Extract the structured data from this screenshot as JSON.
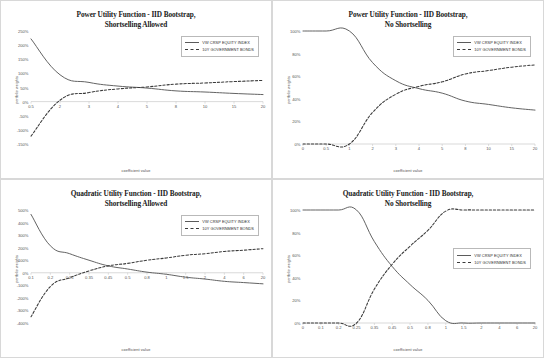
{
  "figure": {
    "background": "#f7f7f7",
    "panel_background": "#ffffff",
    "series_colors": {
      "equity": "#5b5b5b",
      "bonds": "#3a3a3a"
    }
  },
  "legend": {
    "equity_label": "VW CRSP EQUITY INDEX",
    "bonds_label": "10Y GOVERNMENT BONDS"
  },
  "chart_data": [
    {
      "type": "line",
      "panel": "top-left",
      "title_line1": "Power Utility Function - IID Bootstrap,",
      "title_line2": "Shortselling Allowed",
      "xlabel": "coefficient value",
      "ylabel": "portfolio weights",
      "categories": [
        "0.5",
        "2",
        "3",
        "4",
        "5",
        "8",
        "10",
        "15",
        "20"
      ],
      "ytick_labels": [
        "250%",
        "200%",
        "150%",
        "100%",
        "50%",
        "0%",
        "-50%",
        "-100%",
        "-150%"
      ],
      "ylim": [
        -150,
        250
      ],
      "grid": false,
      "legend_position": "top-right",
      "series": [
        {
          "name": "VW CRSP EQUITY INDEX",
          "style": "solid",
          "values": [
            222,
            95,
            68,
            55,
            48,
            38,
            34,
            29,
            25
          ]
        },
        {
          "name": "10Y GOVERNMENT BONDS",
          "style": "dashed",
          "values": [
            -122,
            5,
            32,
            45,
            52,
            62,
            66,
            71,
            75
          ]
        }
      ]
    },
    {
      "type": "line",
      "panel": "top-right",
      "title_line1": "Power Utility Function - IID Bootstrap,",
      "title_line2": "No Shortselling",
      "xlabel": "coefficient value",
      "ylabel": "portfolio weights",
      "categories": [
        "0",
        "0.5",
        "1",
        "2",
        "3",
        "4",
        "5",
        "8",
        "10",
        "15",
        "20"
      ],
      "ytick_labels": [
        "100%",
        "80%",
        "60%",
        "40%",
        "20%",
        "0%"
      ],
      "ylim": [
        0,
        100
      ],
      "grid": false,
      "legend_position": "top-right",
      "series": [
        {
          "name": "VW CRSP EQUITY INDEX",
          "style": "solid",
          "values": [
            100,
            100,
            100,
            72,
            56,
            49,
            45,
            38,
            35,
            32,
            30
          ]
        },
        {
          "name": "10Y GOVERNMENT BONDS",
          "style": "dashed",
          "values": [
            0,
            0,
            0,
            28,
            44,
            51,
            55,
            62,
            65,
            68,
            70
          ]
        }
      ]
    },
    {
      "type": "line",
      "panel": "bottom-left",
      "title_line1": "Quadratic Utility Function - IID Bootstrap,",
      "title_line2": "Shortselling Allowed",
      "xlabel": "coefficient value",
      "ylabel": "portfolio weights",
      "categories": [
        "0.1",
        "0.2",
        "0.25",
        "0.35",
        "0.45",
        "0.5",
        "0.8",
        "1",
        "1.5",
        "2",
        "4",
        "6",
        "20"
      ],
      "ytick_labels": [
        "500%",
        "400%",
        "300%",
        "200%",
        "100%",
        "0%",
        "-100%",
        "-200%",
        "-300%",
        "-400%"
      ],
      "ylim": [
        -400,
        500
      ],
      "grid": false,
      "legend_position": "top-right",
      "series": [
        {
          "name": "VW CRSP EQUITY INDEX",
          "style": "solid",
          "values": [
            465,
            215,
            152,
            100,
            55,
            30,
            5,
            -12,
            -35,
            -50,
            -68,
            -78,
            -88
          ]
        },
        {
          "name": "10Y GOVERNMENT BONDS",
          "style": "dashed",
          "values": [
            -350,
            -110,
            -40,
            15,
            55,
            75,
            100,
            118,
            140,
            152,
            170,
            180,
            192
          ]
        }
      ]
    },
    {
      "type": "line",
      "panel": "bottom-right",
      "title_line1": "Quadratic Utility Function - IID Bootstrap,",
      "title_line2": "No Shortselling",
      "xlabel": "coefficient value",
      "ylabel": "portfolio weights",
      "categories": [
        "0",
        "0.1",
        "0.2",
        "0.25",
        "0.35",
        "0.45",
        "0.5",
        "0.8",
        "1",
        "1.5",
        "2",
        "4",
        "6",
        "20"
      ],
      "ytick_labels": [
        "100%",
        "80%",
        "60%",
        "40%",
        "20%",
        "0%"
      ],
      "ylim": [
        0,
        100
      ],
      "grid": false,
      "legend_position": "middle-right",
      "series": [
        {
          "name": "VW CRSP EQUITY INDEX",
          "style": "solid",
          "values": [
            100,
            100,
            100,
            100,
            72,
            50,
            34,
            20,
            2,
            0,
            0,
            0,
            0,
            0
          ]
        },
        {
          "name": "10Y GOVERNMENT BONDS",
          "style": "dashed",
          "values": [
            0,
            0,
            0,
            0,
            30,
            52,
            68,
            82,
            99,
            100,
            100,
            100,
            100,
            100
          ]
        }
      ]
    }
  ]
}
